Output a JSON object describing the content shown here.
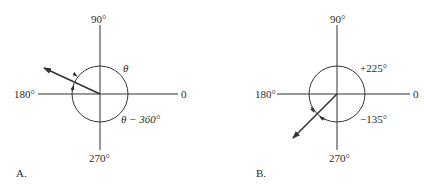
{
  "panels": [
    {
      "id": "A",
      "label": "A.",
      "axes": {
        "top": "90°",
        "left": "180°",
        "right": "0",
        "bottom": "270°"
      },
      "angle_labels": {
        "positive": "θ",
        "negative": "θ − 360°"
      },
      "vector_direction_deg": 155
    },
    {
      "id": "B",
      "label": "B.",
      "axes": {
        "top": "90°",
        "left": "180°",
        "right": "0",
        "bottom": "270°"
      },
      "angle_labels": {
        "positive": "+225°",
        "negative": "−135°"
      },
      "vector_direction_deg": 225
    }
  ],
  "colors": {
    "line": "#333333",
    "background": "#ffffff"
  }
}
